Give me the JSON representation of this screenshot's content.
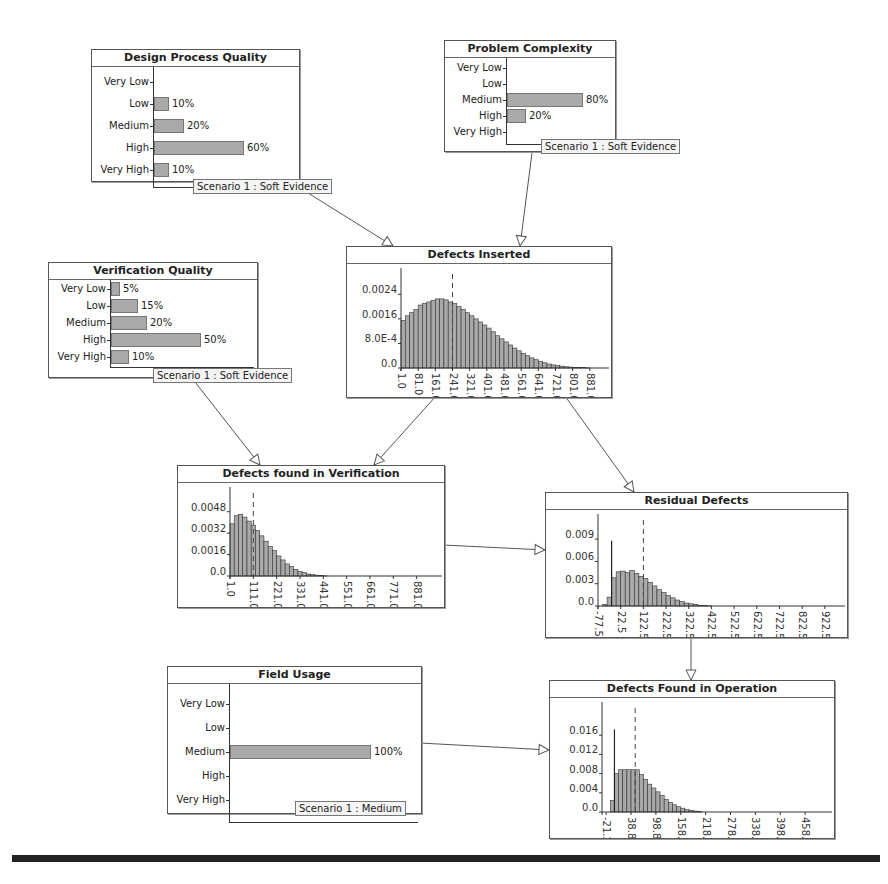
{
  "colors": {
    "bar_fill": "#a9a9a9",
    "bar_stroke": "#555555",
    "node_border": "#555555",
    "edge": "#555555"
  },
  "nodes": {
    "design_process_quality": {
      "title": "Design Process Quality",
      "categories": [
        "Very Low",
        "Low",
        "Medium",
        "High",
        "Very High"
      ],
      "values": [
        0,
        10,
        20,
        60,
        10
      ],
      "labels": [
        "",
        "10%",
        "20%",
        "60%",
        "10%"
      ],
      "evidence": "Scenario 1 : Soft Evidence"
    },
    "problem_complexity": {
      "title": "Problem Complexity",
      "categories": [
        "Very Low",
        "Low",
        "Medium",
        "High",
        "Very High"
      ],
      "values": [
        0,
        0,
        80,
        20,
        0
      ],
      "labels": [
        "",
        "",
        "80%",
        "20%",
        ""
      ],
      "evidence": "Scenario 1 : Soft Evidence"
    },
    "verification_quality": {
      "title": "Verification Quality",
      "categories": [
        "Very Low",
        "Low",
        "Medium",
        "High",
        "Very High"
      ],
      "values": [
        5,
        15,
        20,
        50,
        10
      ],
      "labels": [
        "5%",
        "15%",
        "20%",
        "50%",
        "10%"
      ],
      "evidence": "Scenario 1 : Soft Evidence"
    },
    "field_usage": {
      "title": "Field Usage",
      "categories": [
        "Very Low",
        "Low",
        "Medium",
        "High",
        "Very High"
      ],
      "values": [
        0,
        0,
        100,
        0,
        0
      ],
      "labels": [
        "",
        "",
        "100%",
        "",
        ""
      ],
      "evidence": "Scenario 1 : Medium"
    },
    "defects_inserted": {
      "title": "Defects Inserted",
      "y_ticks": [
        "0.0024",
        "0.0016",
        "8.0E-4",
        "0.0"
      ],
      "x_ticks": [
        "1.0",
        "81.0",
        "161.0",
        "241.0",
        "321.0",
        "401.0",
        "481.0",
        "561.0",
        "641.0",
        "721.0",
        "801.0",
        "881.0"
      ]
    },
    "defects_found_in_verification": {
      "title": "Defects found in Verification",
      "y_ticks": [
        "0.0048",
        "0.0032",
        "0.0016",
        "0.0"
      ],
      "x_ticks": [
        "1.0",
        "111.0",
        "221.0",
        "331.0",
        "441.0",
        "551.0",
        "661.0",
        "771.0",
        "881.0"
      ]
    },
    "residual_defects": {
      "title": "Residual Defects",
      "y_ticks": [
        "0.009",
        "0.006",
        "0.003",
        "0.0"
      ],
      "x_ticks": [
        "-77.5",
        "22.5",
        "122.5",
        "222.5",
        "322.5",
        "422.5",
        "522.5",
        "622.5",
        "722.5",
        "822.5",
        "922.5"
      ]
    },
    "defects_found_in_operation": {
      "title": "Defects Found in Operation",
      "y_ticks": [
        "0.016",
        "0.012",
        "0.008",
        "0.004",
        "0.0"
      ],
      "x_ticks": [
        "-21.2",
        "38.8",
        "98.8",
        "158.8",
        "218.8",
        "278.8",
        "338.8",
        "398.8",
        "458.8"
      ]
    }
  },
  "chart_data": [
    {
      "type": "bar",
      "title": "Design Process Quality",
      "categories": [
        "Very Low",
        "Low",
        "Medium",
        "High",
        "Very High"
      ],
      "values": [
        0,
        10,
        20,
        60,
        10
      ],
      "xlabel": "",
      "ylabel": "",
      "orientation": "horizontal"
    },
    {
      "type": "bar",
      "title": "Problem Complexity",
      "categories": [
        "Very Low",
        "Low",
        "Medium",
        "High",
        "Very High"
      ],
      "values": [
        0,
        0,
        80,
        20,
        0
      ],
      "orientation": "horizontal"
    },
    {
      "type": "bar",
      "title": "Verification Quality",
      "categories": [
        "Very Low",
        "Low",
        "Medium",
        "High",
        "Very High"
      ],
      "values": [
        5,
        15,
        20,
        50,
        10
      ],
      "orientation": "horizontal"
    },
    {
      "type": "bar",
      "title": "Field Usage",
      "categories": [
        "Very Low",
        "Low",
        "Medium",
        "High",
        "Very High"
      ],
      "values": [
        0,
        0,
        100,
        0,
        0
      ],
      "orientation": "horizontal"
    },
    {
      "type": "bar",
      "title": "Defects Inserted",
      "x": [
        1,
        21,
        41,
        61,
        81,
        101,
        121,
        141,
        161,
        181,
        201,
        221,
        241,
        261,
        281,
        301,
        321,
        341,
        361,
        381,
        401,
        421,
        441,
        461,
        481,
        501,
        521,
        541,
        561,
        581,
        601,
        621,
        641,
        661,
        681,
        701,
        721,
        741,
        761,
        781,
        801,
        821,
        841,
        861,
        881
      ],
      "values": [
        0.00155,
        0.0017,
        0.0018,
        0.0019,
        0.00205,
        0.0021,
        0.00215,
        0.0022,
        0.00225,
        0.00225,
        0.00222,
        0.00215,
        0.0021,
        0.002,
        0.0019,
        0.0018,
        0.0017,
        0.0016,
        0.0015,
        0.0014,
        0.0013,
        0.00118,
        0.00105,
        0.00095,
        0.00085,
        0.00075,
        0.00065,
        0.00056,
        0.00048,
        0.0004,
        0.00033,
        0.00027,
        0.00022,
        0.00017,
        0.00013,
        0.0001,
        8e-05,
        6e-05,
        4e-05,
        3e-05,
        2e-05,
        1e-05,
        1e-05,
        5e-06,
        0.0
      ],
      "ylim": [
        0,
        0.0028
      ],
      "y_ticks": [
        0.0,
        0.0008,
        0.0016,
        0.0024
      ],
      "median_marker": 241
    },
    {
      "type": "bar",
      "title": "Defects found in Verification",
      "x": [
        1,
        21,
        41,
        61,
        81,
        101,
        121,
        141,
        161,
        181,
        201,
        221,
        241,
        261,
        281,
        301,
        321,
        341,
        361,
        381,
        401,
        421,
        441,
        461
      ],
      "values": [
        0.0039,
        0.0045,
        0.0046,
        0.0044,
        0.0041,
        0.0038,
        0.0034,
        0.003,
        0.0026,
        0.0022,
        0.0019,
        0.0015,
        0.0012,
        0.0009,
        0.0007,
        0.0005,
        0.00035,
        0.00025,
        0.00015,
        0.0001,
        6e-05,
        3e-05,
        1e-05,
        0.0
      ],
      "ylim": [
        0,
        0.0056
      ],
      "y_ticks": [
        0.0,
        0.0016,
        0.0032,
        0.0048
      ],
      "median_marker": 111
    },
    {
      "type": "bar",
      "title": "Residual Defects",
      "x": [
        -77.5,
        -57.5,
        -37.5,
        -17.5,
        2.5,
        22.5,
        42.5,
        62.5,
        82.5,
        102.5,
        122.5,
        142.5,
        162.5,
        182.5,
        202.5,
        222.5,
        242.5,
        262.5,
        282.5,
        302.5,
        322.5,
        342.5,
        362.5,
        382.5,
        402.5,
        422.5
      ],
      "values": [
        0.0,
        0.0002,
        0.0012,
        0.0038,
        0.0046,
        0.0047,
        0.0045,
        0.0048,
        0.0044,
        0.004,
        0.0037,
        0.0032,
        0.0027,
        0.0022,
        0.0018,
        0.0014,
        0.0011,
        0.0008,
        0.0006,
        0.0004,
        0.0003,
        0.0002,
        0.0001,
        5e-05,
        2e-05,
        0.0
      ],
      "spike": {
        "x": -17.5,
        "value": 0.0088
      },
      "ylim": [
        0,
        0.0105
      ],
      "y_ticks": [
        0.0,
        0.003,
        0.006,
        0.009
      ],
      "median_marker": 122.5
    },
    {
      "type": "bar",
      "title": "Defects Found in Operation",
      "x": [
        -21.2,
        -11.2,
        -1.2,
        8.8,
        18.8,
        28.8,
        38.8,
        48.8,
        58.8,
        68.8,
        78.8,
        88.8,
        98.8,
        108.8,
        118.8,
        128.8,
        138.8,
        148.8,
        158.8,
        168.8,
        178.8,
        188.8,
        198.8,
        208.8
      ],
      "values": [
        0.0,
        0.0024,
        0.008,
        0.0088,
        0.0088,
        0.0088,
        0.0088,
        0.0088,
        0.0078,
        0.0068,
        0.0058,
        0.005,
        0.0042,
        0.0034,
        0.0026,
        0.002,
        0.0015,
        0.0011,
        0.0008,
        0.0005,
        0.0003,
        0.0002,
        0.0001,
        0.0
      ],
      "spike": {
        "x": -1.2,
        "value": 0.0172
      },
      "ylim": [
        0,
        0.02
      ],
      "y_ticks": [
        0.0,
        0.004,
        0.008,
        0.012,
        0.016
      ],
      "median_marker": 48.8
    }
  ]
}
